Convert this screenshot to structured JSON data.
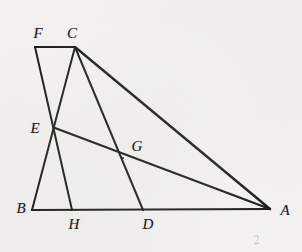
{
  "figure": {
    "canvas": {
      "width": 302,
      "height": 252
    },
    "background_color": "#f3f2f0",
    "stroke_color": "#1d1d1c",
    "label_color": "#20201f",
    "points": [
      {
        "id": "A",
        "label": "A",
        "x": 270,
        "y": 209,
        "label_x": 285,
        "label_y": 210
      },
      {
        "id": "B",
        "label": "B",
        "x": 32,
        "y": 210,
        "label_x": 21,
        "label_y": 208
      },
      {
        "id": "C",
        "label": "C",
        "x": 75,
        "y": 47,
        "label_x": 72,
        "label_y": 33
      },
      {
        "id": "D",
        "label": "D",
        "x": 143,
        "y": 210,
        "label_x": 148,
        "label_y": 224
      },
      {
        "id": "E",
        "label": "E",
        "x": 55,
        "y": 128,
        "label_x": 35,
        "label_y": 128
      },
      {
        "id": "F",
        "label": "F",
        "x": 35,
        "y": 47,
        "label_x": 38,
        "label_y": 33
      },
      {
        "id": "G",
        "label": "G",
        "x": 123,
        "y": 158,
        "label_x": 137,
        "label_y": 146
      },
      {
        "id": "H",
        "label": "H",
        "x": 72,
        "y": 210,
        "label_x": 74,
        "label_y": 224
      }
    ],
    "segments": [
      {
        "name": "segment-BA",
        "from": "B",
        "to": "A",
        "width": 2.2
      },
      {
        "name": "segment-FC",
        "from": "F",
        "to": "C",
        "width": 2.2
      },
      {
        "name": "segment-FH",
        "from": "F",
        "to": "H",
        "width": 2.0
      },
      {
        "name": "segment-CB",
        "from": "C",
        "to": "B",
        "width": 2.0
      },
      {
        "name": "segment-CD",
        "from": "C",
        "to": "D",
        "width": 2.0
      },
      {
        "name": "segment-CA",
        "from": "C",
        "to": "A",
        "width": 2.4
      },
      {
        "name": "segment-EA",
        "from": "E",
        "to": "A",
        "width": 2.2
      }
    ],
    "smudge_mark": "2"
  }
}
